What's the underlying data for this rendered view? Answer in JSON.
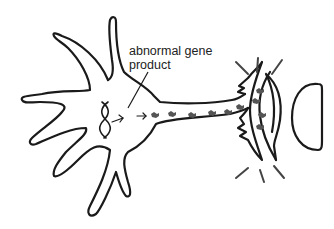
{
  "diagram": {
    "type": "neuron-illustration",
    "label": {
      "line1": "abnormal gene",
      "line2": "product"
    },
    "components": [
      "neuron-cell-body",
      "dendrites",
      "dna-double-helix",
      "expression-arrow",
      "axon",
      "abnormal-protein-aggregates",
      "axon-terminal",
      "synapse-burst-lines",
      "postsynaptic-cell"
    ],
    "colors": {
      "stroke": "#1a1a1a",
      "protein": "#555555",
      "burst": "#444444",
      "text": "#222222"
    }
  }
}
